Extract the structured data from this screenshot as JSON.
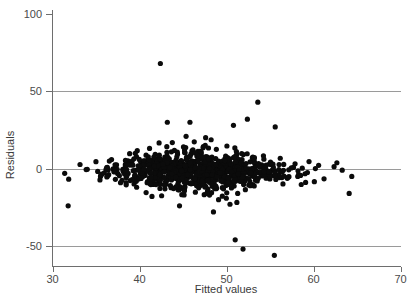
{
  "chart_data": {
    "type": "scatter",
    "title": "",
    "xlabel": "Fitted values",
    "ylabel": "Residuals",
    "xlim": [
      30,
      70
    ],
    "ylim": [
      -62,
      105
    ],
    "xticks": [
      30,
      40,
      50,
      60,
      70
    ],
    "yticks": [
      100,
      50,
      0,
      -50
    ],
    "xtick_labels": [
      "30",
      "40",
      "50",
      "60",
      "70"
    ],
    "ytick_labels": [
      "100",
      "50",
      "0",
      "-50"
    ],
    "grid": "horizontal gridlines at y = 50, 0, -50",
    "legend": "none",
    "marker": {
      "shape": "circle",
      "color": "#0b0b0b",
      "radius_px": 2.6
    },
    "series": [
      {
        "name": "residuals",
        "n_points": 900,
        "center_x": 46.5,
        "spread_x": 5.0,
        "center_y": -1.0,
        "spread_y": 7.5,
        "x_min": 31.4,
        "x_max": 64.6,
        "y_min": -56,
        "y_max": 68
      }
    ],
    "outliers": [
      {
        "x": 42.4,
        "y": 68
      },
      {
        "x": 53.6,
        "y": 43
      },
      {
        "x": 43.2,
        "y": 30
      },
      {
        "x": 45.8,
        "y": 30
      },
      {
        "x": 52.4,
        "y": 32
      },
      {
        "x": 50.8,
        "y": 28
      },
      {
        "x": 55.6,
        "y": 27
      },
      {
        "x": 31.4,
        "y": -3
      },
      {
        "x": 31.8,
        "y": -24
      },
      {
        "x": 44.6,
        "y": -24
      },
      {
        "x": 48.5,
        "y": -28
      },
      {
        "x": 50.4,
        "y": -23
      },
      {
        "x": 51.0,
        "y": -46
      },
      {
        "x": 51.9,
        "y": -52
      },
      {
        "x": 55.5,
        "y": -56
      },
      {
        "x": 63.3,
        "y": -1
      },
      {
        "x": 64.4,
        "y": -5
      },
      {
        "x": 64.1,
        "y": -16
      }
    ]
  },
  "axes": {
    "x_axis_name": "fitted-values-axis",
    "y_axis_name": "residuals-axis"
  }
}
